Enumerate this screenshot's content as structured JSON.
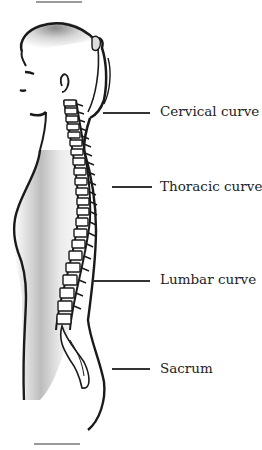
{
  "diagram": {
    "labels": [
      {
        "id": "cervical",
        "text": "Cervical curve"
      },
      {
        "id": "thoracic",
        "text": "Thoracic curve"
      },
      {
        "id": "lumbar",
        "text": "Lumbar curve"
      },
      {
        "id": "sacrum",
        "text": "Sacrum"
      }
    ]
  },
  "colors": {
    "outline": "#1a1a1a",
    "shade": "#9a9a9a",
    "text": "#222222",
    "leader": "#333333"
  }
}
